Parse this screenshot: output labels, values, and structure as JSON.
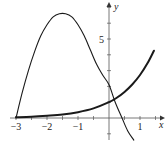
{
  "chart_data": {
    "type": "line",
    "title": "",
    "xlabel": "x",
    "ylabel": "y",
    "xlim": [
      -3.2,
      1.5
    ],
    "ylim": [
      -1.5,
      7.5
    ],
    "grid": false,
    "legend": null,
    "x_ticks": [
      {
        "value": -3,
        "label": "-3"
      },
      {
        "value": -2,
        "label": "-2"
      },
      {
        "value": -1,
        "label": "-1"
      },
      {
        "value": 1,
        "label": "1"
      }
    ],
    "y_ticks": [
      {
        "value": 5,
        "label": "5"
      }
    ],
    "series": [
      {
        "name": "falling-curve",
        "style": "thin",
        "points": [
          [
            -3,
            0
          ],
          [
            -2.8,
            1.6
          ],
          [
            -2.6,
            3.0
          ],
          [
            -2.4,
            4.2
          ],
          [
            -2.2,
            5.2
          ],
          [
            -2.0,
            5.9
          ],
          [
            -1.8,
            6.4
          ],
          [
            -1.6,
            6.6
          ],
          [
            -1.4,
            6.6
          ],
          [
            -1.2,
            6.4
          ],
          [
            -1.0,
            5.9
          ],
          [
            -0.8,
            5.2
          ],
          [
            -0.6,
            4.3
          ],
          [
            -0.4,
            3.4
          ],
          [
            -0.2,
            2.7
          ],
          [
            0,
            2.1
          ],
          [
            0.2,
            1.0
          ],
          [
            0.42,
            0
          ],
          [
            0.6,
            -0.8
          ],
          [
            0.8,
            -1.4
          ]
        ]
      },
      {
        "name": "exponential-curve",
        "style": "thick",
        "points": [
          [
            -3,
            0.05
          ],
          [
            -2.5,
            0.08
          ],
          [
            -2,
            0.14
          ],
          [
            -1.5,
            0.22
          ],
          [
            -1,
            0.37
          ],
          [
            -0.5,
            0.61
          ],
          [
            0,
            1.0
          ],
          [
            0.25,
            1.28
          ],
          [
            0.5,
            1.65
          ],
          [
            0.75,
            2.12
          ],
          [
            1.0,
            2.72
          ],
          [
            1.25,
            3.49
          ],
          [
            1.45,
            4.26
          ]
        ]
      }
    ]
  }
}
